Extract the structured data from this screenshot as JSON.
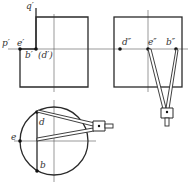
{
  "diagram": {
    "type": "orthographic-projection-construction",
    "colors": {
      "line": "#2a2a2a",
      "thin": "#555555",
      "point": "#111111",
      "background": "#ffffff"
    },
    "front_view": {
      "labels": {
        "p": "p′",
        "e": "e′",
        "q": "q′",
        "b": "b′",
        "d": "(d′)"
      }
    },
    "side_view": {
      "labels": {
        "d": "d″",
        "e": "e″",
        "b": "b″"
      },
      "tool": "compass-icon"
    },
    "top_view": {
      "labels": {
        "d": "d",
        "e": "e",
        "b": "b"
      },
      "tool": "compass-icon"
    }
  }
}
